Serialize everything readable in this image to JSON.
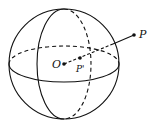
{
  "diagram": {
    "type": "sphere-inversion",
    "labels": {
      "center": "O",
      "inner_point": "P'",
      "outer_point": "P"
    },
    "colors": {
      "stroke": "#111111",
      "background": "#ffffff"
    }
  }
}
